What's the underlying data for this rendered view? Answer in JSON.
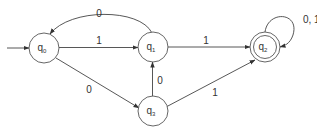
{
  "diagram": {
    "type": "DFA",
    "states": [
      {
        "id": "q0",
        "label": "q",
        "sub": "0",
        "start": true,
        "accepting": false
      },
      {
        "id": "q1",
        "label": "q",
        "sub": "1",
        "start": false,
        "accepting": false
      },
      {
        "id": "q2",
        "label": "q",
        "sub": "2",
        "start": false,
        "accepting": true
      },
      {
        "id": "q3",
        "label": "q",
        "sub": "3",
        "start": false,
        "accepting": false
      }
    ],
    "transitions": [
      {
        "from": "q0",
        "to": "q1",
        "label": "1"
      },
      {
        "from": "q1",
        "to": "q0",
        "label": "0"
      },
      {
        "from": "q0",
        "to": "q3",
        "label": "0"
      },
      {
        "from": "q3",
        "to": "q1",
        "label": "0"
      },
      {
        "from": "q1",
        "to": "q2",
        "label": "1"
      },
      {
        "from": "q3",
        "to": "q2",
        "label": "1"
      },
      {
        "from": "q2",
        "to": "q2",
        "label": "0, 1"
      }
    ]
  }
}
